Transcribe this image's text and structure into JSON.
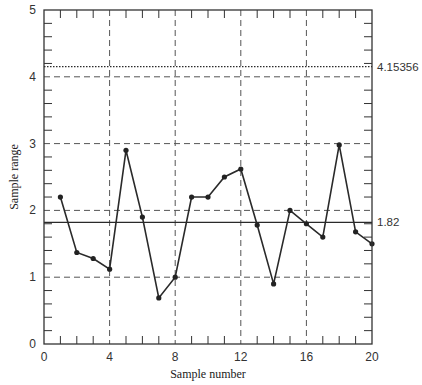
{
  "chart_data": {
    "type": "line",
    "title": "",
    "xlabel": "Sample number",
    "ylabel": "Sample range",
    "xlim": [
      0,
      20
    ],
    "ylim": [
      0,
      5
    ],
    "x_ticks": [
      0,
      4,
      8,
      12,
      16,
      20
    ],
    "y_ticks": [
      0,
      1,
      2,
      3,
      4,
      5
    ],
    "grid": "dashed at major ticks",
    "x": [
      1,
      2,
      3,
      4,
      5,
      6,
      7,
      8,
      9,
      10,
      11,
      12,
      13,
      14,
      15,
      16,
      17,
      18,
      19,
      20
    ],
    "series": [
      {
        "name": "Sample range",
        "values": [
          2.2,
          1.37,
          1.28,
          1.12,
          2.9,
          1.9,
          0.69,
          1.0,
          2.2,
          2.2,
          2.5,
          2.62,
          1.78,
          0.9,
          2.0,
          1.8,
          1.6,
          2.98,
          1.68,
          1.5
        ]
      }
    ],
    "reference_lines": [
      {
        "name": "center line",
        "value": 1.82,
        "label": "1.82",
        "style": "solid"
      },
      {
        "name": "upper control limit",
        "value": 4.15356,
        "label": "4.15356",
        "style": "dotted"
      }
    ]
  },
  "colors": {
    "line": "#2a2a2a",
    "grid": "#555555",
    "frame": "#333333"
  }
}
